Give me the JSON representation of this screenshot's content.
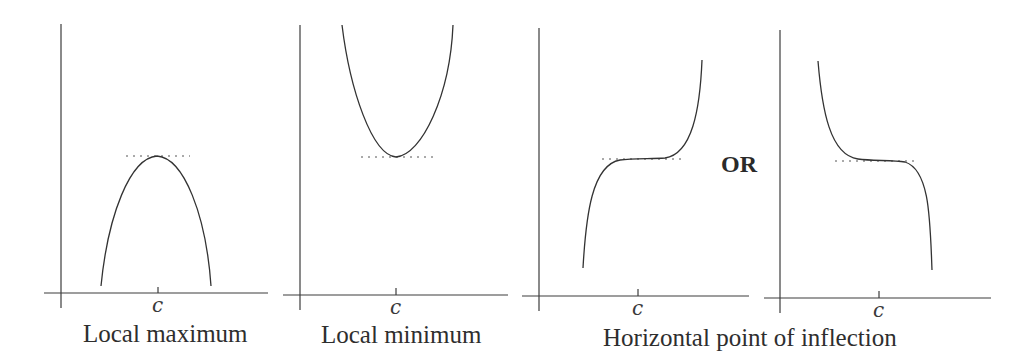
{
  "figure": {
    "colors": {
      "background": "#ffffff",
      "ink": "#333333"
    },
    "separator": "OR",
    "panels": [
      {
        "id": "local-maximum",
        "tick_label": "c",
        "caption": "Local maximum",
        "shape": "concave-down parabola with peak at c"
      },
      {
        "id": "local-minimum",
        "tick_label": "c",
        "caption": "Local minimum",
        "shape": "concave-up parabola with minimum at c"
      },
      {
        "id": "inflection-increasing",
        "tick_label": "c",
        "caption": "",
        "shape": "increasing cubic with horizontal tangent at c"
      },
      {
        "id": "inflection-decreasing",
        "tick_label": "c",
        "caption": "",
        "shape": "decreasing cubic with horizontal tangent at c"
      }
    ],
    "shared_caption": "Horizontal point of inflection"
  }
}
